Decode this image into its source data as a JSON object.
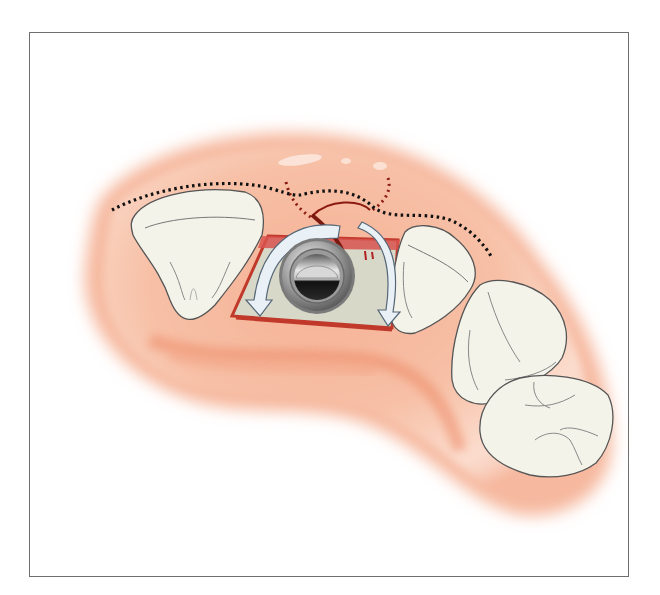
{
  "figure": {
    "frame": {
      "x": 29,
      "y": 32,
      "width": 600,
      "height": 545,
      "border_color": "#6f6f6f"
    },
    "colors": {
      "gingiva_light": "#f9d3c0",
      "gingiva_mid": "#f2a888",
      "gingiva_dark": "#e8805e",
      "tooth_fill": "#f4f3ea",
      "tooth_outline": "#555555",
      "flap_border": "#c0392b",
      "suture_red": "#8b1a10",
      "incision_dots": "#1a1a1a",
      "arrow_fill": "#e9f1f7",
      "arrow_stroke": "#556677",
      "implant_metal": "#a8a8a8",
      "implant_dark": "#1e1e1e"
    },
    "elements": {
      "teeth": [
        "central-incisor",
        "lateral-incisor",
        "canine",
        "premolar"
      ],
      "implant": "healing-abutment",
      "arrows": [
        "flap-rotation-left",
        "flap-rotation-right"
      ],
      "lines": [
        "incision-dotted-line",
        "suture-dotted-loop"
      ]
    }
  }
}
